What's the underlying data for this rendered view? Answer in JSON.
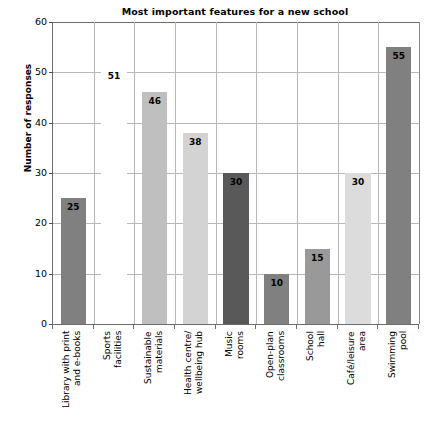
{
  "chart_data": {
    "type": "bar",
    "title": "Most important features for a new school",
    "xlabel": "",
    "ylabel": "Number of responses",
    "ylim": [
      0,
      60
    ],
    "ytick_step": 10,
    "yticks": [
      "0",
      "10",
      "20",
      "30",
      "40",
      "50",
      "60"
    ],
    "grid": "horizontal-and-vertical",
    "legend": "none",
    "categories": [
      "Library with print\nand e-books",
      "Sports\nfacilities",
      "Sustainable\nmaterials",
      "Health centre/\nwellbeing hub",
      "Music\nrooms",
      "Open-plan\nclassrooms",
      "School\nhall",
      "Café/leisure\narea",
      "Swimming\npool"
    ],
    "values": [
      25,
      51,
      46,
      38,
      30,
      10,
      15,
      30,
      55
    ],
    "bar_colors": [
      "#808080",
      "#ffffff",
      "#bfbfbf",
      "#d3d3d3",
      "#595959",
      "#808080",
      "#999999",
      "#dcdcdc",
      "#808080"
    ],
    "data_labels": [
      "25",
      "51",
      "46",
      "38",
      "30",
      "10",
      "15",
      "30",
      "55"
    ]
  },
  "axis_colors": {
    "axis_line": "#6d6d6d",
    "gridline": "#b8b8b8",
    "text": "#000000"
  }
}
